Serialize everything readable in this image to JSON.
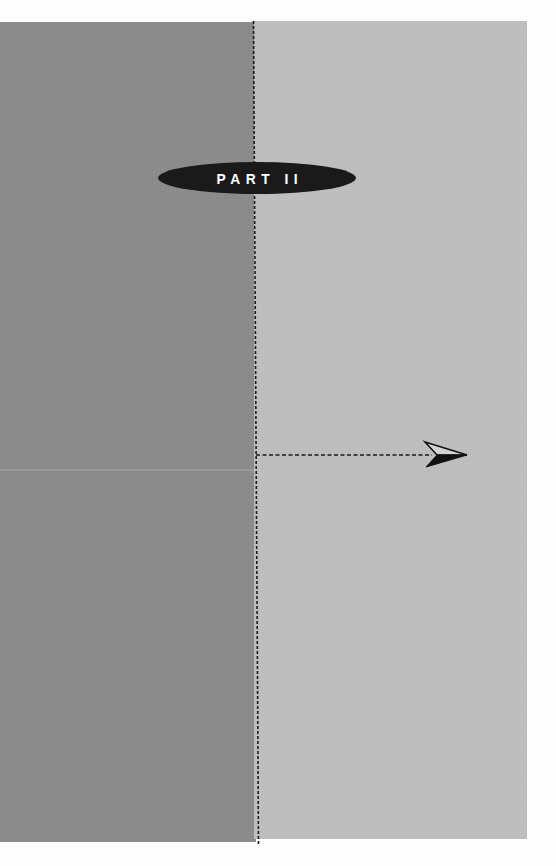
{
  "page": {
    "type": "part-divider",
    "part_label": "PART II"
  },
  "colors": {
    "left_panel": "#8b8b8b",
    "right_panel": "#bebebe",
    "badge": "#1a1a1a",
    "badge_text": "#ffffff",
    "dashed_line": "#1a1a1a"
  },
  "decorations": {
    "vertical_divider": "dashed-line",
    "horizontal_connector": "dashed-arrow",
    "arrow_icon": "paper-plane-arrow-icon"
  }
}
